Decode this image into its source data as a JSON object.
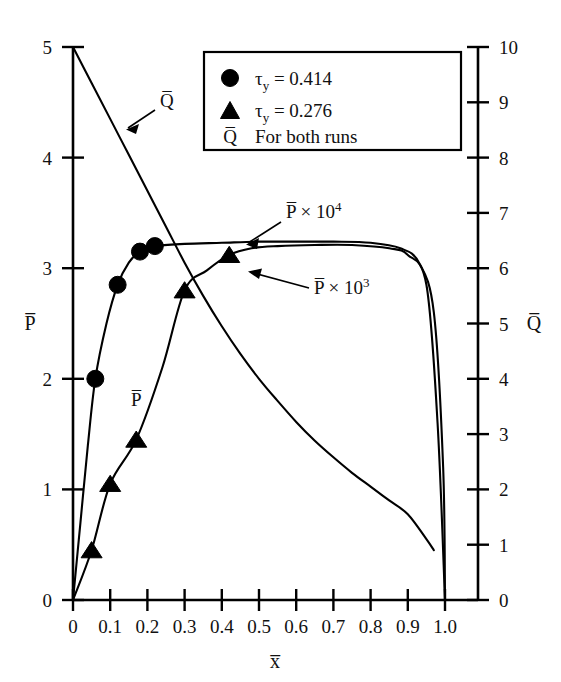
{
  "figure": {
    "background_color": "#ffffff",
    "ink_color": "#000000"
  },
  "axes": {
    "left": {
      "title": "P̅",
      "ticks": [
        "0",
        "1",
        "2",
        "3",
        "4",
        "5"
      ],
      "min": 0,
      "max": 5
    },
    "right": {
      "title": "Q̅",
      "ticks": [
        "0",
        "1",
        "2",
        "3",
        "4",
        "5",
        "6",
        "7",
        "8",
        "9",
        "10"
      ],
      "min": 0,
      "max": 10
    },
    "bottom": {
      "title": "x̅",
      "ticks": [
        "0",
        "0.1",
        "0.2",
        "0.3",
        "0.4",
        "0.5",
        "0.6",
        "0.7",
        "0.8",
        "0.9",
        "1.0"
      ],
      "min": 0,
      "max": 1.0
    }
  },
  "legend": {
    "entries": [
      {
        "marker": "circle",
        "label_main": "τ",
        "label_sub": "y",
        "label_rest": " = 0.414"
      },
      {
        "marker": "triangle",
        "label_main": "τ",
        "label_sub": "y",
        "label_rest": " = 0.276"
      },
      {
        "marker": "qbar",
        "label_main": "Q̅",
        "label_sub": "",
        "label_rest": "For both runs"
      }
    ]
  },
  "annotations": [
    {
      "name": "qbar-curve-label",
      "text": "Q̅",
      "sup": ""
    },
    {
      "name": "pbar-1e4-label",
      "text": "P̅ × 10",
      "sup": "4"
    },
    {
      "name": "pbar-1e3-label",
      "text": "P̅ × 10",
      "sup": "3"
    },
    {
      "name": "pbar-rising-label",
      "text": "P̅",
      "sup": ""
    }
  ],
  "chart_data": {
    "type": "line",
    "title": "",
    "xlabel": "x̅",
    "ylabel": "P̅",
    "y2label": "Q̅",
    "xlim": [
      0,
      1.0
    ],
    "ylim": [
      0,
      5
    ],
    "y2lim": [
      0,
      10
    ],
    "grid": false,
    "legend_position": "top-center",
    "series": [
      {
        "name": "Q̅ For both runs",
        "axis": "right",
        "marker": "none",
        "comment": "descending curve from (0,10) to about (0.97,0.9) on right axis",
        "x": [
          0.0,
          0.05,
          0.1,
          0.15,
          0.2,
          0.25,
          0.3,
          0.35,
          0.4,
          0.45,
          0.5,
          0.55,
          0.6,
          0.65,
          0.7,
          0.75,
          0.8,
          0.85,
          0.9,
          0.95,
          0.97
        ],
        "y": [
          10.0,
          9.35,
          8.7,
          8.05,
          7.4,
          6.75,
          6.1,
          5.5,
          4.95,
          4.45,
          4.0,
          3.6,
          3.22,
          2.88,
          2.58,
          2.3,
          2.05,
          1.8,
          1.55,
          1.1,
          0.9
        ]
      },
      {
        "name": "P̅ × 10⁴",
        "axis": "left",
        "marker": "circle",
        "marker_label": "τy = 0.414",
        "comment": "steeply rising then flat plateau near 3.2, vertical drop to 0 at x=1.0",
        "x": [
          0.0,
          0.02,
          0.04,
          0.06,
          0.09,
          0.12,
          0.15,
          0.18,
          0.22,
          0.3,
          0.4,
          0.5,
          0.6,
          0.7,
          0.8,
          0.88,
          0.93,
          0.97,
          0.995,
          1.0
        ],
        "y": [
          0.0,
          0.7,
          1.4,
          2.0,
          2.5,
          2.85,
          3.05,
          3.15,
          3.2,
          3.22,
          3.23,
          3.24,
          3.24,
          3.24,
          3.23,
          3.18,
          3.05,
          2.6,
          1.2,
          0.0
        ],
        "marker_points": [
          {
            "x": 0.06,
            "y": 2.0
          },
          {
            "x": 0.12,
            "y": 2.85
          },
          {
            "x": 0.18,
            "y": 3.15
          },
          {
            "x": 0.22,
            "y": 3.2
          }
        ]
      },
      {
        "name": "P̅ × 10³",
        "axis": "left",
        "marker": "triangle",
        "marker_label": "τy = 0.276",
        "comment": "slower rise, joins plateau near 3.2 at about x=0.5, vertical drop to 0 at x=1.0",
        "x": [
          0.0,
          0.05,
          0.1,
          0.17,
          0.24,
          0.3,
          0.36,
          0.42,
          0.48,
          0.55,
          0.65,
          0.75,
          0.85,
          0.9,
          0.95,
          0.98,
          1.0
        ],
        "y": [
          0.0,
          0.45,
          1.05,
          1.45,
          2.1,
          2.8,
          2.98,
          3.12,
          3.18,
          3.2,
          3.21,
          3.21,
          3.18,
          3.12,
          2.85,
          1.6,
          0.0
        ],
        "marker_points": [
          {
            "x": 0.05,
            "y": 0.45
          },
          {
            "x": 0.1,
            "y": 1.05
          },
          {
            "x": 0.17,
            "y": 1.45
          },
          {
            "x": 0.3,
            "y": 2.8
          },
          {
            "x": 0.42,
            "y": 3.12
          }
        ]
      }
    ]
  }
}
